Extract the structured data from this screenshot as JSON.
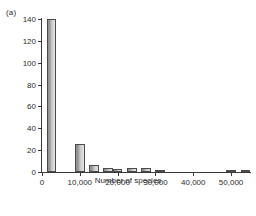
{
  "figure": {
    "panel_label": "(a)"
  },
  "chart_data": {
    "type": "bar",
    "title": "",
    "subtitle": "",
    "xlabel": "Number of species",
    "ylabel": "Number of countries",
    "xlim": [
      0,
      55000
    ],
    "ylim": [
      0,
      140
    ],
    "grid": false,
    "legend": null,
    "bin_width": 2500,
    "x_tick_labels": [
      "0",
      "10,000",
      "20,000",
      "30,000",
      "40,000",
      "50,000"
    ],
    "x_tick_values": [
      0,
      10000,
      20000,
      30000,
      40000,
      50000
    ],
    "y_tick_labels": [
      "0",
      "20",
      "40",
      "60",
      "80",
      "100",
      "120",
      "140"
    ],
    "y_tick_values": [
      0,
      20,
      40,
      60,
      80,
      100,
      120,
      140
    ],
    "bin_starts": [
      1250,
      8750,
      12500,
      16250,
      18750,
      22500,
      26250,
      30000,
      48750,
      52500
    ],
    "values": [
      140,
      26,
      6,
      4,
      3,
      4,
      4,
      2,
      2,
      2
    ],
    "bars": [
      {
        "x": 1250,
        "value": 140
      },
      {
        "x": 8750,
        "value": 26
      },
      {
        "x": 12500,
        "value": 6
      },
      {
        "x": 16250,
        "value": 4
      },
      {
        "x": 18750,
        "value": 3
      },
      {
        "x": 22500,
        "value": 4
      },
      {
        "x": 26250,
        "value": 4
      },
      {
        "x": 30000,
        "value": 2
      },
      {
        "x": 48750,
        "value": 2
      },
      {
        "x": 52500,
        "value": 2
      }
    ]
  }
}
